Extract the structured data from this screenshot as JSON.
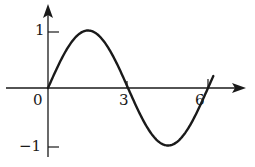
{
  "chart_data": {
    "type": "line",
    "title": "",
    "xlabel": "",
    "ylabel": "",
    "function": "y = sin(pi*x/3)",
    "xlim": [
      0,
      6.3
    ],
    "ylim": [
      -1,
      1
    ],
    "grid": false,
    "legend": null,
    "x_ticks": [
      {
        "value": 0,
        "label": "0"
      },
      {
        "value": 3,
        "label": "3"
      },
      {
        "value": 6,
        "label": "6"
      }
    ],
    "y_ticks": [
      {
        "value": 1,
        "label": "1"
      },
      {
        "value": -1,
        "label": "−1"
      }
    ],
    "series": [
      {
        "name": "curve",
        "x": [
          0,
          0.5,
          1,
          1.5,
          2,
          2.5,
          3,
          3.5,
          4,
          4.5,
          5,
          5.5,
          6,
          6.2
        ],
        "y": [
          0,
          0.5,
          0.87,
          1,
          0.87,
          0.5,
          0,
          -0.5,
          -0.87,
          -1,
          -0.87,
          -0.5,
          0,
          0.21
        ]
      }
    ],
    "colors": {
      "ink": "#1a1a1a",
      "background": "#ffffff"
    }
  },
  "labels": {
    "origin": "0",
    "x3": "3",
    "x6": "6",
    "y1": "1",
    "yneg1": "−1"
  }
}
